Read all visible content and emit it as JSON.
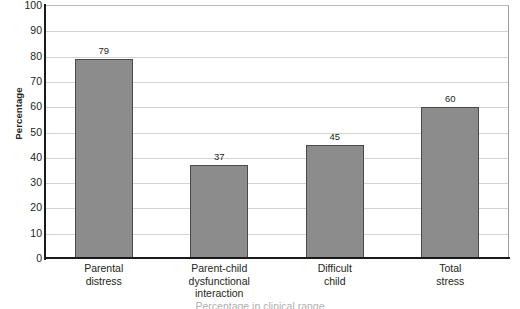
{
  "chart_data": {
    "type": "bar",
    "title": "",
    "subtitle": "",
    "xlabel": "",
    "ylabel": "Percentage",
    "ylim": [
      0,
      100
    ],
    "ytick_step": 10,
    "yticks": [
      100,
      90,
      80,
      70,
      60,
      50,
      40,
      30,
      20,
      10,
      0
    ],
    "categories": [
      "Parental distress",
      "Parent-child dysfunctional interaction",
      "Difficult child",
      "Total stress"
    ],
    "category_lines": [
      [
        "Parental",
        "distress"
      ],
      [
        "Parent-child",
        "dysfunctional",
        "interaction"
      ],
      [
        "Difficult",
        "child"
      ],
      [
        "Total",
        "stress"
      ]
    ],
    "values": [
      79,
      37,
      45,
      60
    ],
    "value_labels": [
      "79",
      "37",
      "45",
      "60"
    ],
    "grid": true,
    "grid_axis": "y",
    "legend": false,
    "legend_position": "none",
    "bar_color": "#8c8c8c",
    "bar_border_color": "#4a4a4a",
    "gridline_color": "#d4d4d4",
    "axis_color": "#1a1a1a",
    "text_color": "#231f20"
  },
  "caption": {
    "cut_off_text": "Percentage in clinical range"
  }
}
